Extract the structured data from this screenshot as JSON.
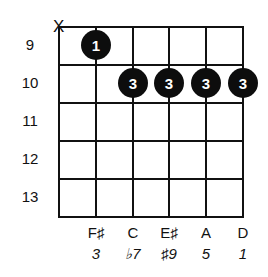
{
  "chord_diagram": {
    "mute_marker": "X",
    "frets": [
      "9",
      "10",
      "11",
      "12",
      "13"
    ],
    "strings": 6,
    "fingers": [
      {
        "string": 2,
        "fret_index": 0,
        "finger": "1"
      },
      {
        "string": 3,
        "fret_index": 1,
        "finger": "3"
      },
      {
        "string": 4,
        "fret_index": 1,
        "finger": "3"
      },
      {
        "string": 5,
        "fret_index": 1,
        "finger": "3"
      },
      {
        "string": 6,
        "fret_index": 1,
        "finger": "3"
      }
    ],
    "notes": [
      "F♯",
      "C",
      "E♯",
      "A",
      "D"
    ],
    "intervals": [
      "3",
      "♭7",
      "♯9",
      "5",
      "1"
    ]
  }
}
